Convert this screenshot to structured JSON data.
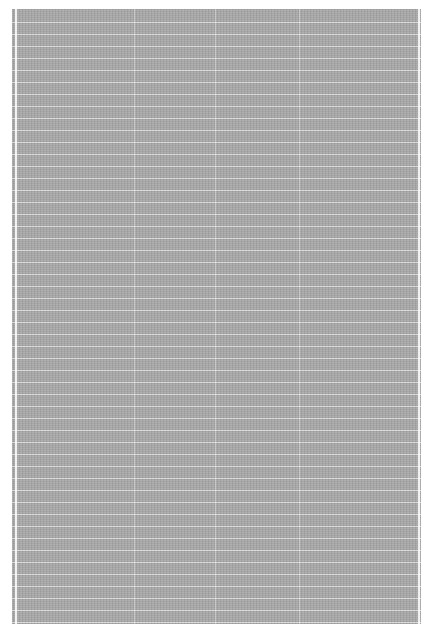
{
  "canvas": {
    "background": "#ffffff",
    "panel_color": "#a9a9a9",
    "grid_line_color": "#ffffff",
    "row_spacing_px": 12,
    "vertical_lines_x": [
      3,
      122,
      203,
      287,
      406
    ]
  }
}
